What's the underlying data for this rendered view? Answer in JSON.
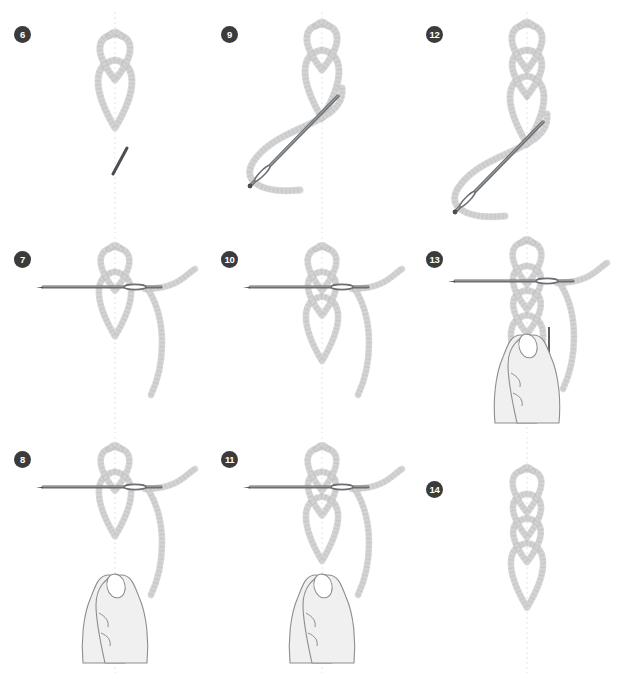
{
  "figure": {
    "title": "Rope loop knot tying sequence",
    "background_color": "#ffffff",
    "rope_color": "#d2d2d2",
    "rope_shade_color": "#b9b9b9",
    "needle_color": "#6b6f73",
    "needle_dark_color": "#4a4e52",
    "hand_fill_color": "#f0f0f0",
    "hand_line_color": "#8d8d8d",
    "guide_color": "#e4e4e4",
    "badge_color": "#3b3b3b",
    "badge_text_color": "#ffffff",
    "arrow_color": "#2b2b2b",
    "columns": 3,
    "rows": 3
  },
  "steps": [
    {
      "number": "6",
      "id": "step-6",
      "column": 1,
      "row": 1,
      "loops": 2,
      "has_needle": true,
      "needle_orientation": "diagonal-short",
      "has_hands": false,
      "has_arrow": false,
      "has_guideline": true,
      "description": "Two nested rope loops with a short needle below"
    },
    {
      "number": "7",
      "id": "step-7",
      "column": 1,
      "row": 2,
      "loops": 2,
      "has_needle": true,
      "needle_orientation": "horizontal",
      "has_hands": false,
      "has_arrow": false,
      "has_guideline": true,
      "description": "Needle threaded horizontally through the loops with working end curving right"
    },
    {
      "number": "8",
      "id": "step-8",
      "column": 1,
      "row": 3,
      "loops": 2,
      "has_needle": true,
      "needle_orientation": "horizontal",
      "has_hands": true,
      "has_arrow": false,
      "has_guideline": true,
      "description": "Two thumbs pinch the rope below the needle"
    },
    {
      "number": "9",
      "id": "step-9",
      "column": 2,
      "row": 1,
      "loops": 2,
      "has_needle": true,
      "needle_orientation": "diagonal-long",
      "has_hands": false,
      "has_arrow": false,
      "has_guideline": true,
      "description": "Long needle drawn diagonally down-left through the rope bight"
    },
    {
      "number": "10",
      "id": "step-10",
      "column": 2,
      "row": 2,
      "loops": 3,
      "has_needle": true,
      "needle_orientation": "horizontal",
      "has_hands": false,
      "has_arrow": false,
      "has_guideline": true,
      "description": "Needle horizontal through three stacked loops"
    },
    {
      "number": "11",
      "id": "step-11",
      "column": 2,
      "row": 3,
      "loops": 3,
      "has_needle": true,
      "needle_orientation": "horizontal",
      "has_hands": true,
      "has_arrow": false,
      "has_guideline": true,
      "description": "Thumbs pinch beneath the three-loop chain"
    },
    {
      "number": "12",
      "id": "step-12",
      "column": 3,
      "row": 1,
      "loops": 3,
      "has_needle": true,
      "needle_orientation": "diagonal-long",
      "has_hands": false,
      "has_arrow": false,
      "has_guideline": true,
      "description": "Long needle pulled diagonally through the lengthened chain"
    },
    {
      "number": "13",
      "id": "step-13",
      "column": 3,
      "row": 2,
      "loops": 4,
      "has_needle": true,
      "needle_orientation": "horizontal",
      "has_hands": true,
      "has_arrow": true,
      "arrow_direction": "down",
      "has_guideline": true,
      "description": "Downward arrow shows tightening pull while thumbs hold the chain"
    },
    {
      "number": "14",
      "id": "step-14",
      "column": 3,
      "row": 3,
      "loops": 4,
      "has_needle": false,
      "needle_orientation": "none",
      "has_hands": false,
      "has_arrow": false,
      "has_guideline": true,
      "description": "Finished chain of four interlocking rope loops"
    }
  ]
}
